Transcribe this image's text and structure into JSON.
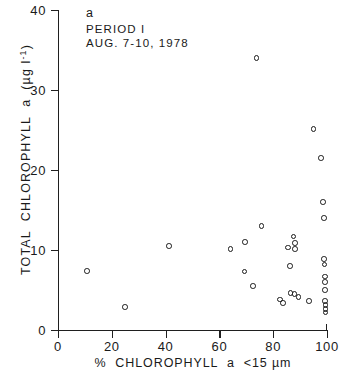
{
  "chart_data": {
    "type": "scatter",
    "title": "",
    "panel_label": "a",
    "annotations": [
      "PERIOD I",
      "AUG. 7-10, 1978"
    ],
    "xlabel": "% CHLOROPHYLL a <15 µm",
    "ylabel": "TOTAL CHLOROPHYLL a (µg l⁻¹)",
    "xlim": [
      0,
      100
    ],
    "ylim": [
      0,
      40
    ],
    "xticks": [
      0,
      20,
      40,
      60,
      80,
      100
    ],
    "yticks": [
      0,
      10,
      20,
      30,
      40
    ],
    "xticklabels": [
      "0",
      "20",
      "40",
      "60",
      "80",
      "100"
    ],
    "yticklabels": [
      "0",
      "10",
      "20",
      "30",
      "40"
    ],
    "grid": false,
    "legend": "none",
    "marker": "open-circle",
    "marker_color": "#1a1a1a",
    "points": [
      {
        "x": 10.8,
        "y": 7.4
      },
      {
        "x": 24.8,
        "y": 2.9
      },
      {
        "x": 41.2,
        "y": 10.5
      },
      {
        "x": 64.2,
        "y": 10.1
      },
      {
        "x": 69.6,
        "y": 11.0
      },
      {
        "x": 69.4,
        "y": 7.3
      },
      {
        "x": 72.6,
        "y": 5.5
      },
      {
        "x": 73.8,
        "y": 34.0
      },
      {
        "x": 75.6,
        "y": 13.0
      },
      {
        "x": 82.6,
        "y": 3.8
      },
      {
        "x": 83.6,
        "y": 3.4
      },
      {
        "x": 85.4,
        "y": 10.3
      },
      {
        "x": 86.2,
        "y": 8.0
      },
      {
        "x": 86.5,
        "y": 4.6
      },
      {
        "x": 87.6,
        "y": 11.7
      },
      {
        "x": 88.0,
        "y": 10.9
      },
      {
        "x": 88.2,
        "y": 10.1
      },
      {
        "x": 87.9,
        "y": 4.5
      },
      {
        "x": 89.4,
        "y": 4.1
      },
      {
        "x": 93.4,
        "y": 3.6
      },
      {
        "x": 95.0,
        "y": 25.1
      },
      {
        "x": 97.8,
        "y": 21.5
      },
      {
        "x": 98.6,
        "y": 16.0
      },
      {
        "x": 98.8,
        "y": 14.0
      },
      {
        "x": 98.8,
        "y": 8.9
      },
      {
        "x": 99.0,
        "y": 8.2
      },
      {
        "x": 99.2,
        "y": 6.7
      },
      {
        "x": 99.2,
        "y": 6.0
      },
      {
        "x": 99.3,
        "y": 5.0
      },
      {
        "x": 99.3,
        "y": 3.6
      },
      {
        "x": 99.4,
        "y": 3.1
      },
      {
        "x": 99.4,
        "y": 2.6
      },
      {
        "x": 99.5,
        "y": 2.2
      }
    ]
  }
}
